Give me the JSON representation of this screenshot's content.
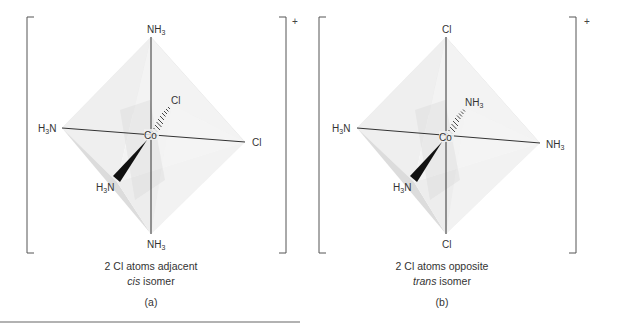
{
  "figure": {
    "panels": [
      {
        "id": "a",
        "panel_label": "(a)",
        "charge": "+",
        "center_atom": "Co",
        "ligands": {
          "top": {
            "main": "NH",
            "sub": "3"
          },
          "bottom": {
            "main": "NH",
            "sub": "3"
          },
          "left": {
            "pre": "H",
            "sub": "3",
            "post": "N"
          },
          "right": {
            "main": "Cl"
          },
          "back": {
            "main": "Cl"
          },
          "front": {
            "pre": "H",
            "sub": "3",
            "post": "N"
          }
        },
        "caption_line1": "2 Cl atoms adjacent",
        "caption_italic": "cis",
        "caption_line2_rest": " isomer"
      },
      {
        "id": "b",
        "panel_label": "(b)",
        "charge": "+",
        "center_atom": "Co",
        "ligands": {
          "top": {
            "main": "Cl"
          },
          "bottom": {
            "main": "Cl"
          },
          "left": {
            "pre": "H",
            "sub": "3",
            "post": "N"
          },
          "right": {
            "main": "NH",
            "sub": "3"
          },
          "back": {
            "main": "NH",
            "sub": "3"
          },
          "front": {
            "pre": "H",
            "sub": "3",
            "post": "N"
          }
        },
        "caption_line1": "2 Cl atoms opposite",
        "caption_italic": "trans",
        "caption_line2_rest": " isomer"
      }
    ],
    "colors": {
      "line": "#333333",
      "face_light": "#ececec",
      "face_mid": "#dedede",
      "face_dark": "#cfcfcf",
      "bracket": "#555555"
    }
  }
}
